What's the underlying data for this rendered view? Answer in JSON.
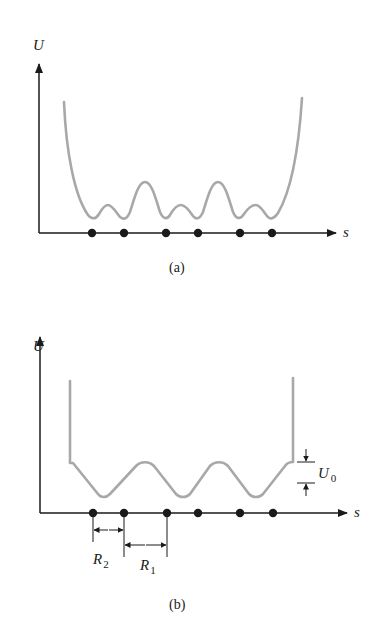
{
  "figure": {
    "panel_a": {
      "caption": "(a)",
      "y_axis_label": "U",
      "x_axis_label": "s",
      "atom_count": 6,
      "description": "Smooth potential energy U vs position s with alternating small and large barriers between six atomic sites; steep walls at both ends"
    },
    "panel_b": {
      "caption": "(b)",
      "y_axis_label": "U",
      "x_axis_label": "s",
      "atom_count": 6,
      "barrier_label": "U",
      "barrier_subscript": "0",
      "spacing_labels": [
        {
          "letter": "R",
          "subscript": "2"
        },
        {
          "letter": "R",
          "subscript": "1"
        }
      ],
      "description": "Idealized periodic potential with three wells of equal depth, step height U0 at the edges, infinite walls at both ends"
    }
  },
  "colors": {
    "ink": "#1a1a1a",
    "curve": "#a8a8a8",
    "background": "#ffffff"
  }
}
